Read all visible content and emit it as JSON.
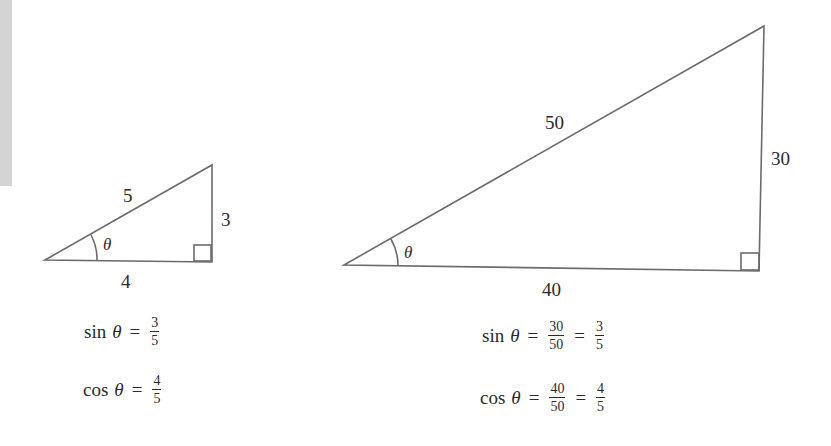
{
  "left_triangle": {
    "hypotenuse": "5",
    "opposite": "3",
    "adjacent": "4",
    "angle": "θ",
    "sin_eq": {
      "fn": "sin",
      "var": "θ",
      "eq": "=",
      "num": "3",
      "den": "5"
    },
    "cos_eq": {
      "fn": "cos",
      "var": "θ",
      "eq": "=",
      "num": "4",
      "den": "5"
    }
  },
  "right_triangle": {
    "hypotenuse": "50",
    "opposite": "30",
    "adjacent": "40",
    "angle": "θ",
    "sin_eq": {
      "fn": "sin",
      "var": "θ",
      "eq": "=",
      "num1": "30",
      "den1": "50",
      "eq2": "=",
      "num2": "3",
      "den2": "5"
    },
    "cos_eq": {
      "fn": "cos",
      "var": "θ",
      "eq": "=",
      "num1": "40",
      "den1": "50",
      "eq2": "=",
      "num2": "4",
      "den2": "5"
    }
  },
  "colors": {
    "line": "#6b6b6b",
    "text": "#2a2a2a",
    "strip": "#d4d4d4"
  }
}
